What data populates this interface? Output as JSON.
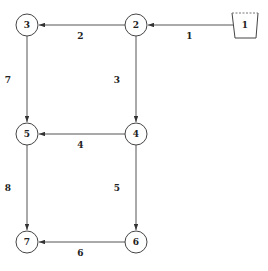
{
  "colors": {
    "line": "#555555",
    "text": "#222222",
    "background": "#ffffff"
  },
  "nodes": [
    {
      "id": "1",
      "label": "1",
      "shape": "tank"
    },
    {
      "id": "2",
      "label": "2",
      "shape": "circle"
    },
    {
      "id": "3",
      "label": "3",
      "shape": "circle"
    },
    {
      "id": "4",
      "label": "4",
      "shape": "circle"
    },
    {
      "id": "5",
      "label": "5",
      "shape": "circle"
    },
    {
      "id": "6",
      "label": "6",
      "shape": "circle"
    },
    {
      "id": "7",
      "label": "7",
      "shape": "circle"
    }
  ],
  "edges": [
    {
      "label": "1",
      "from": "1",
      "to": "2"
    },
    {
      "label": "2",
      "from": "2",
      "to": "3"
    },
    {
      "label": "3",
      "from": "2",
      "to": "4"
    },
    {
      "label": "4",
      "from": "4",
      "to": "5"
    },
    {
      "label": "5",
      "from": "4",
      "to": "6"
    },
    {
      "label": "6",
      "from": "6",
      "to": "7"
    },
    {
      "label": "7",
      "from": "3",
      "to": "5"
    },
    {
      "label": "8",
      "from": "5",
      "to": "7"
    }
  ]
}
